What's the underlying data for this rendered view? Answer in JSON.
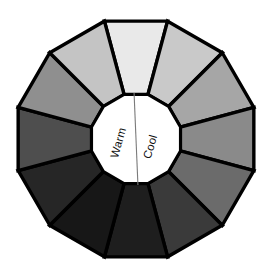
{
  "figure": {
    "name": "value-wheel",
    "background_color": "#ffffff",
    "outline_color": "#000000",
    "segment_count": 12,
    "hub": {
      "fill_color": "#ffffff",
      "divider_color": "#7a7a7a",
      "labels": [
        {
          "text": "Warm",
          "side": "left",
          "rotation_deg": -74
        },
        {
          "text": "Cool",
          "side": "right",
          "rotation_deg": -74
        }
      ]
    },
    "segments": [
      {
        "index": 0,
        "position": "top",
        "angle_deg": 0,
        "color": "#e9e9e9",
        "value_label": "lightest"
      },
      {
        "index": 1,
        "position": "top-right",
        "angle_deg": 30,
        "color": "#c9c9c9",
        "value_label": "very light"
      },
      {
        "index": 2,
        "position": "upper-right",
        "angle_deg": 60,
        "color": "#a6a6a6",
        "value_label": "light"
      },
      {
        "index": 3,
        "position": "right",
        "angle_deg": 90,
        "color": "#8a8a8a",
        "value_label": "light-mid"
      },
      {
        "index": 4,
        "position": "lower-right",
        "angle_deg": 120,
        "color": "#6b6b6b",
        "value_label": "mid"
      },
      {
        "index": 5,
        "position": "bottom-right",
        "angle_deg": 150,
        "color": "#3a3a3a",
        "value_label": "dark"
      },
      {
        "index": 6,
        "position": "bottom",
        "angle_deg": 180,
        "color": "#1e1e1e",
        "value_label": "very dark"
      },
      {
        "index": 7,
        "position": "bottom-left",
        "angle_deg": 210,
        "color": "#171717",
        "value_label": "darkest"
      },
      {
        "index": 8,
        "position": "lower-left",
        "angle_deg": 240,
        "color": "#262626",
        "value_label": "very dark"
      },
      {
        "index": 9,
        "position": "left",
        "angle_deg": 270,
        "color": "#4e4e4e",
        "value_label": "dark-mid"
      },
      {
        "index": 10,
        "position": "upper-left",
        "angle_deg": 300,
        "color": "#8f8f8f",
        "value_label": "mid-light"
      },
      {
        "index": 11,
        "position": "top-left",
        "angle_deg": 330,
        "color": "#c4c4c4",
        "value_label": "very light"
      }
    ]
  }
}
